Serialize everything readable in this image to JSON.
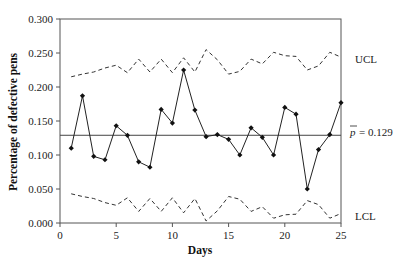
{
  "chart_data": {
    "type": "line",
    "title": "",
    "xlabel": "Days",
    "ylabel": "Percentage of defective pens",
    "xlim": [
      0,
      25
    ],
    "ylim": [
      0,
      0.3
    ],
    "xticks": [
      0,
      5,
      10,
      15,
      20,
      25
    ],
    "yticks": [
      "0.000",
      "0.050",
      "0.100",
      "0.150",
      "0.200",
      "0.250",
      "0.300"
    ],
    "grid": false,
    "legend": "none",
    "x": [
      1,
      2,
      3,
      4,
      5,
      6,
      7,
      8,
      9,
      10,
      11,
      12,
      13,
      14,
      15,
      16,
      17,
      18,
      19,
      20,
      21,
      22,
      23,
      24,
      25
    ],
    "series": [
      {
        "name": "p",
        "style": "solid-markers",
        "values": [
          0.11,
          0.187,
          0.098,
          0.093,
          0.143,
          0.129,
          0.09,
          0.082,
          0.167,
          0.147,
          0.225,
          0.166,
          0.127,
          0.13,
          0.123,
          0.1,
          0.14,
          0.126,
          0.1,
          0.17,
          0.16,
          0.05,
          0.108,
          0.13,
          0.177
        ]
      },
      {
        "name": "UCL",
        "style": "dashed",
        "values": [
          0.215,
          0.219,
          0.222,
          0.228,
          0.232,
          0.221,
          0.241,
          0.222,
          0.241,
          0.221,
          0.243,
          0.222,
          0.255,
          0.24,
          0.219,
          0.223,
          0.241,
          0.234,
          0.251,
          0.246,
          0.245,
          0.225,
          0.231,
          0.251,
          0.244
        ]
      },
      {
        "name": "LCL",
        "style": "dashed",
        "values": [
          0.043,
          0.039,
          0.036,
          0.03,
          0.026,
          0.037,
          0.017,
          0.036,
          0.017,
          0.037,
          0.015,
          0.036,
          0.003,
          0.018,
          0.039,
          0.035,
          0.017,
          0.024,
          0.007,
          0.012,
          0.013,
          0.033,
          0.027,
          0.007,
          0.014
        ]
      }
    ],
    "center_line": {
      "name": "p-bar",
      "value": 0.129,
      "label_value": "= 0.129"
    },
    "annotations": [
      "UCL",
      "LCL"
    ]
  },
  "labels": {
    "ucl": "UCL",
    "lcl": "LCL",
    "pbar_symbol": "p",
    "pbar_value": "= 0.129",
    "xlabel": "Days",
    "ylabel": "Percentage of defective pens"
  }
}
